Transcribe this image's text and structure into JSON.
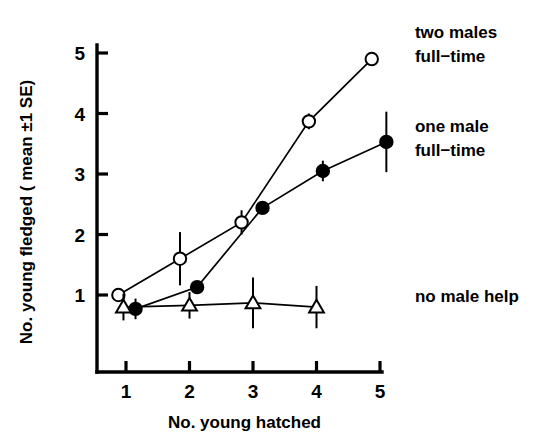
{
  "chart_data": {
    "type": "line",
    "title": "",
    "xlabel": "No. young hatched",
    "ylabel": "No. young fledged ( mean ±1 SE)",
    "xlim": [
      0.55,
      5.45
    ],
    "ylim": [
      0.3,
      5.35
    ],
    "xticks": [
      1,
      2,
      3,
      4,
      5
    ],
    "xticklabels": [
      "1",
      "2",
      "3",
      "4",
      "5"
    ],
    "yticks": [
      1,
      2,
      3,
      4,
      5
    ],
    "yticklabels": [
      "1",
      "2",
      "3",
      "4",
      "5"
    ],
    "grid": false,
    "legend_position": "right-inline-annotations",
    "series": [
      {
        "name": "two males full-time",
        "marker": "open-circle",
        "x": [
          0.88,
          1.85,
          2.82,
          3.88,
          4.87
        ],
        "values": [
          1.0,
          1.6,
          2.2,
          3.87,
          4.9
        ],
        "errors": [
          0.0,
          0.44,
          0.2,
          0.13,
          0.11
        ]
      },
      {
        "name": "one male full-time",
        "marker": "filled-circle",
        "x": [
          1.15,
          2.12,
          3.15,
          4.1,
          5.1
        ],
        "values": [
          0.77,
          1.13,
          2.44,
          3.05,
          3.53
        ],
        "errors": [
          0.17,
          0.1,
          0.1,
          0.17,
          0.5
        ]
      },
      {
        "name": "no male help",
        "marker": "open-triangle",
        "x": [
          0.96,
          2.0,
          3.0,
          4.0
        ],
        "values": [
          0.8,
          0.83,
          0.87,
          0.8
        ],
        "errors": [
          0.22,
          0.22,
          0.42,
          0.35
        ]
      }
    ],
    "annotations": [
      {
        "id": "two-males",
        "line1": "two males",
        "line2": "full−time",
        "x": 5.55,
        "y": 5.25
      },
      {
        "id": "one-male",
        "line1": "one male",
        "line2": "full−time",
        "x": 5.55,
        "y": 3.7
      },
      {
        "id": "no-help",
        "line1": "no male help",
        "line2": "",
        "x": 5.55,
        "y": 0.88
      }
    ],
    "colors": {
      "foreground": "#000000",
      "background": "#ffffff",
      "marker_fill_open": "#ffffff",
      "marker_fill_solid": "#000000"
    }
  }
}
